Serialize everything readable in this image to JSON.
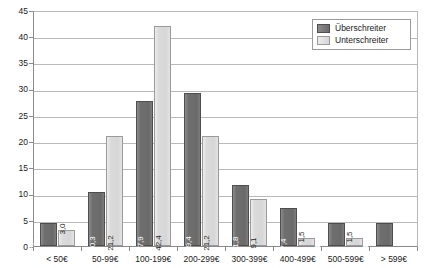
{
  "chart_data": {
    "type": "bar",
    "title": "",
    "subtitle": "",
    "xlabel": "",
    "ylabel": "",
    "ylim": [
      0,
      45
    ],
    "y_ticks": [
      0,
      5,
      10,
      15,
      20,
      25,
      30,
      35,
      40,
      45
    ],
    "grid": true,
    "legend_position": "top-right",
    "categories": [
      "< 50€",
      "50-99€",
      "100-199€",
      "200-299€",
      "300-399€",
      "400-499€",
      "500-599€",
      "> 599€"
    ],
    "series": [
      {
        "name": "Überschreiter",
        "color": "#6f6f6f",
        "values": [
          4.4,
          10.3,
          27.9,
          29.4,
          11.8,
          7.4,
          4.4,
          4.4
        ],
        "labels": [
          "4,4",
          "10,3",
          "27,9",
          "29,4",
          "11,8",
          "7,4",
          "4,4",
          "4,4"
        ]
      },
      {
        "name": "Unterschreiter",
        "color": "#d9d9d9",
        "values": [
          3.0,
          21.2,
          42.4,
          21.2,
          9.1,
          1.5,
          1.5,
          null
        ],
        "labels": [
          "3,0",
          "21,2",
          "42,4",
          "21,2",
          "9,1",
          "1,5",
          "1,5",
          ""
        ]
      }
    ]
  },
  "legend": {
    "items": [
      {
        "label": "Überschreiter"
      },
      {
        "label": "Unterschreiter"
      }
    ]
  },
  "axis": {
    "y_tick_labels": [
      "45",
      "40",
      "35",
      "30",
      "25",
      "20",
      "15",
      "10",
      "5",
      "0"
    ]
  }
}
